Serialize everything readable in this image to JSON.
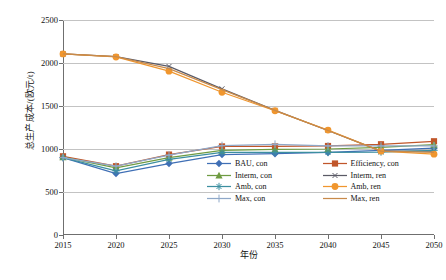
{
  "chart_data": {
    "type": "line",
    "title": "",
    "xlabel": "年份",
    "ylabel": "总生产成本/(欧元/t)",
    "x": [
      2015,
      2020,
      2025,
      2030,
      2035,
      2040,
      2045,
      2050
    ],
    "xticks": [
      "2015",
      "2020",
      "2025",
      "2030",
      "2035",
      "2040",
      "2045",
      "2050"
    ],
    "yticks": [
      "0",
      "500",
      "1000",
      "1500",
      "2000",
      "2500"
    ],
    "ylim": [
      0,
      2500
    ],
    "xlim": [
      2015,
      2050
    ],
    "grid": "horizontal",
    "legend_position": "inside-lower-right",
    "series": [
      {
        "name": "BAU, con",
        "color": "#3f6fb5",
        "marker": "diamond",
        "values": [
          900,
          715,
          830,
          935,
          945,
          960,
          985,
          1010
        ]
      },
      {
        "name": "Efficiency, con",
        "color": "#c0562a",
        "marker": "square",
        "values": [
          915,
          800,
          935,
          1030,
          1030,
          1035,
          1055,
          1090
        ]
      },
      {
        "name": "Interm, con",
        "color": "#6f9b42",
        "marker": "triangle",
        "values": [
          905,
          780,
          900,
          985,
          995,
          1000,
          1020,
          1050
        ]
      },
      {
        "name": "Interm, ren",
        "color": "#5a5a66",
        "marker": "star",
        "values": [
          2105,
          2075,
          1960,
          1700,
          1450,
          1215,
          975,
          975
        ]
      },
      {
        "name": "Amb, con",
        "color": "#3c8fa0",
        "marker": "asterisk",
        "values": [
          900,
          745,
          880,
          960,
          960,
          960,
          965,
          985
        ]
      },
      {
        "name": "Amb, ren",
        "color": "#f0962e",
        "marker": "circle",
        "values": [
          2105,
          2070,
          1905,
          1660,
          1445,
          1220,
          975,
          940
        ]
      },
      {
        "name": "Max, con",
        "color": "#8fa8c8",
        "marker": "plus",
        "values": [
          900,
          800,
          930,
          1040,
          1055,
          1035,
          1035,
          1035
        ]
      },
      {
        "name": "Max, ren",
        "color": "#c88a4a",
        "marker": "line",
        "values": [
          2105,
          2075,
          1935,
          1690,
          1450,
          1215,
          975,
          960
        ]
      }
    ]
  },
  "legend": {
    "items": [
      {
        "label": "BAU, con"
      },
      {
        "label": "Efficiency, con"
      },
      {
        "label": "Interm, con"
      },
      {
        "label": "Interm, ren"
      },
      {
        "label": "Amb, con"
      },
      {
        "label": "Amb, ren"
      },
      {
        "label": "Max, con"
      },
      {
        "label": "Max, ren"
      }
    ]
  }
}
